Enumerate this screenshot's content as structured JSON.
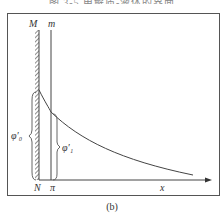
{
  "header": {
    "cut_off_text": "图 3-5 电解质-液体的界面"
  },
  "labels": {
    "M": "M",
    "m": "m",
    "N": "N",
    "pi": "π",
    "x": "x",
    "phi0": "φ′₀",
    "phi1": "φ′₁"
  },
  "caption": "(b)",
  "colors": {
    "line": "#444444",
    "frame": "#555555"
  }
}
